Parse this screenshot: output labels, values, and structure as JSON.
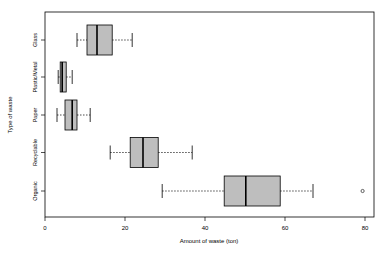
{
  "chart_data": {
    "type": "boxplot",
    "orientation": "horizontal",
    "title": "",
    "xlabel": "Amount of waste (ton)",
    "ylabel": "Type of waste",
    "xlim": [
      0,
      82
    ],
    "x_ticks": [
      0,
      20,
      40,
      60,
      80
    ],
    "x_tick_labels": [
      "0",
      "20",
      "40",
      "60",
      "80"
    ],
    "categories": [
      "Organic",
      "Recyclable",
      "Paper",
      "Plastic/Metal",
      "Glass"
    ],
    "box_fill": "#bebebe",
    "line_color": "#000000",
    "grid": false,
    "legend": null,
    "series": [
      {
        "name": "Organic",
        "whisker_low": 29.3,
        "q1": 44.8,
        "median": 50.2,
        "q3": 58.8,
        "whisker_high": 67.0,
        "outliers": [
          79.4
        ]
      },
      {
        "name": "Recyclable",
        "whisker_low": 16.3,
        "q1": 21.3,
        "median": 24.5,
        "q3": 28.3,
        "whisker_high": 36.8,
        "outliers": []
      },
      {
        "name": "Paper",
        "whisker_low": 3.0,
        "q1": 5.0,
        "median": 6.8,
        "q3": 8.0,
        "whisker_high": 11.3,
        "outliers": []
      },
      {
        "name": "Plastic/Metal",
        "whisker_low": 3.3,
        "q1": 3.8,
        "median": 4.3,
        "q3": 5.3,
        "whisker_high": 6.8,
        "outliers": []
      },
      {
        "name": "Glass",
        "whisker_low": 8.0,
        "q1": 10.5,
        "median": 13.0,
        "q3": 16.8,
        "whisker_high": 21.8,
        "outliers": []
      }
    ]
  }
}
